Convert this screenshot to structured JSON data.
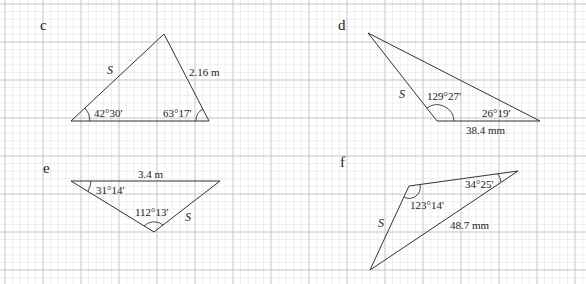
{
  "grid": {
    "minor_spacing": 7.6,
    "major_spacing": 38,
    "offset_x": 5,
    "offset_y": 4,
    "minor_color": "#e2e2e2",
    "major_color": "#bdbdbd"
  },
  "problems": [
    {
      "id": "c",
      "label": "c",
      "unknown": "S",
      "side_given": "2.16 m",
      "angles": [
        "42°30'",
        "63°17'"
      ]
    },
    {
      "id": "d",
      "label": "d",
      "unknown": "S",
      "side_given": "38.4 mm",
      "angles": [
        "129°27'",
        "26°19'"
      ]
    },
    {
      "id": "e",
      "label": "e",
      "unknown": "S",
      "side_given": "3.4 m",
      "angles": [
        "31°14'",
        "112°13'"
      ]
    },
    {
      "id": "f",
      "label": "f",
      "unknown": "S",
      "side_given": "48.7 mm",
      "angles": [
        "34°25'",
        "123°14'"
      ]
    }
  ]
}
